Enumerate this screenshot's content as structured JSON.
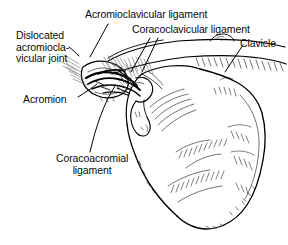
{
  "figure": {
    "kind": "anatomical-line-drawing",
    "ink_color": "#000000",
    "background_color": "#ffffff"
  },
  "labels": {
    "dislocated_joint": {
      "line1": "Dislocated",
      "line2": "acromiocla-",
      "line3": "vicular joint"
    },
    "acromioclavicular_ligament": "Acromioclavicular ligament",
    "coracoclavicular_ligament": "Coracoclavicular ligament",
    "clavicle": "Clavicle",
    "acromion": "Acromion",
    "coracoacromial_ligament": {
      "line1": "Coracoacromial",
      "line2": "ligament"
    }
  },
  "structures": [
    "clavicle",
    "acromion",
    "coracoid process",
    "scapular body",
    "glenoid region",
    "torn acromioclavicular ligament",
    "coracoclavicular ligament",
    "coracoacromial ligament"
  ]
}
